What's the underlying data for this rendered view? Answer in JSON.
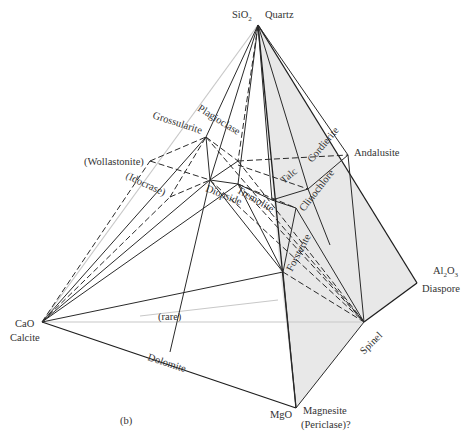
{
  "figure": {
    "panel_label": "(b)",
    "vertices": {
      "sio2": {
        "formula": "SiO",
        "sub": "2",
        "mineral": "Quartz"
      },
      "cao": {
        "formula": "CaO",
        "mineral": "Calcite"
      },
      "al2o3": {
        "formula_a": "Al",
        "sub_a": "2",
        "formula_b": "O",
        "sub_b": "3",
        "mineral": "Diaspore"
      },
      "mgo": {
        "formula": "MgO",
        "mineral": "Magnesite",
        "mineral_alt": "(Periclase)?"
      }
    },
    "phases": {
      "plagioclase": "Plagioclase",
      "grossularite": "Grossularite",
      "wollastonite": "(Wollastonite)",
      "idocrase": "(Idocrase)",
      "diopside": "Diopside",
      "tremolite": "Tremolite",
      "talc": "Talc",
      "cordierite": "Cordierite",
      "andalusite": "Andalusite",
      "clinochlore": "Clinochlore",
      "forsterite": "Forsterite",
      "spinel": "Spinel",
      "dolomite": "Dolomite",
      "rare": "(rare)"
    },
    "colors": {
      "shade": "#e6e6e6",
      "line": "#1e1e1e",
      "text": "#333333"
    }
  }
}
